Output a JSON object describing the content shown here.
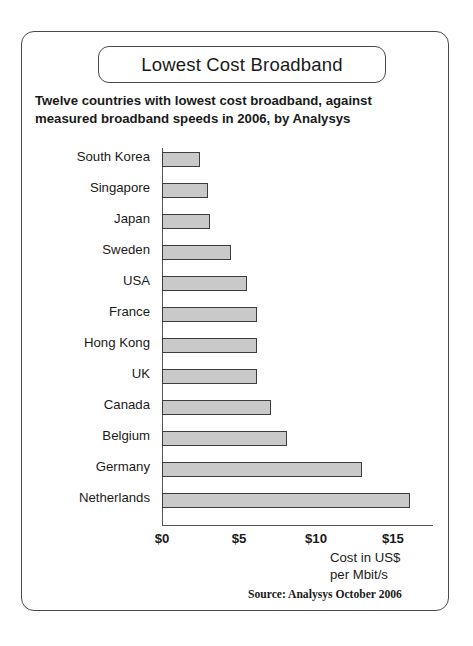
{
  "chart_data": {
    "type": "bar",
    "orientation": "horizontal",
    "title": "Lowest Cost Broadband",
    "subtitle_lines": [
      "Twelve countries with lowest cost broadband, against",
      "measured broadband speeds in 2006, by Analysys"
    ],
    "categories": [
      "South Korea",
      "Singapore",
      "Japan",
      "Sweden",
      "USA",
      "France",
      "Hong Kong",
      "UK",
      "Canada",
      "Belgium",
      "Germany",
      "Netherlands"
    ],
    "values": [
      2.5,
      3.0,
      3.1,
      4.5,
      5.5,
      6.2,
      6.2,
      6.2,
      7.1,
      8.1,
      13.0,
      16.1
    ],
    "xlabel_lines": [
      "Cost in US$",
      "per Mbit/s"
    ],
    "ylabel": "",
    "xlim": [
      0,
      17.6
    ],
    "xticks": [
      0,
      5,
      10,
      15
    ],
    "xtick_labels": [
      "$0",
      "$5",
      "$10",
      "$15"
    ],
    "grid": false,
    "legend": "none",
    "source": "Source: Analysys October 2006",
    "bar_fill_color": "#c9c9c9",
    "bar_border_color": "#3d3d3d",
    "axis_color": "#555555",
    "frame_color": "#4a4a4a",
    "background_color": "#ffffff"
  }
}
